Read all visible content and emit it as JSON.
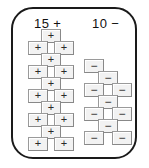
{
  "diagram": {
    "frame": {
      "stroke_color": "#1a1a1a"
    },
    "clusters": [
      {
        "id": "left",
        "label": "15 +",
        "count": 15,
        "polarity": "+",
        "terminal_symbol": "+",
        "terminals": [
          {
            "symbol": "+",
            "x": 41,
            "y": 29
          },
          {
            "symbol": "+",
            "x": 28,
            "y": 41
          },
          {
            "symbol": "+",
            "x": 54,
            "y": 41
          },
          {
            "symbol": "+",
            "x": 41,
            "y": 53
          },
          {
            "symbol": "+",
            "x": 28,
            "y": 65
          },
          {
            "symbol": "+",
            "x": 54,
            "y": 65
          },
          {
            "symbol": "+",
            "x": 41,
            "y": 77
          },
          {
            "symbol": "+",
            "x": 28,
            "y": 89
          },
          {
            "symbol": "+",
            "x": 54,
            "y": 89
          },
          {
            "symbol": "+",
            "x": 41,
            "y": 101
          },
          {
            "symbol": "+",
            "x": 28,
            "y": 113
          },
          {
            "symbol": "+",
            "x": 54,
            "y": 113
          },
          {
            "symbol": "+",
            "x": 41,
            "y": 125
          },
          {
            "symbol": "+",
            "x": 28,
            "y": 137
          },
          {
            "symbol": "+",
            "x": 54,
            "y": 137
          }
        ]
      },
      {
        "id": "right",
        "label": "10 −",
        "count": 10,
        "polarity": "−",
        "terminal_symbol": "−",
        "terminals": [
          {
            "symbol": "−",
            "x": 84,
            "y": 59
          },
          {
            "symbol": "−",
            "x": 98,
            "y": 71
          },
          {
            "symbol": "−",
            "x": 84,
            "y": 83
          },
          {
            "symbol": "−",
            "x": 112,
            "y": 83
          },
          {
            "symbol": "−",
            "x": 98,
            "y": 95
          },
          {
            "symbol": "−",
            "x": 84,
            "y": 107
          },
          {
            "symbol": "−",
            "x": 112,
            "y": 107
          },
          {
            "symbol": "−",
            "x": 98,
            "y": 119
          },
          {
            "symbol": "−",
            "x": 84,
            "y": 131
          },
          {
            "symbol": "−",
            "x": 112,
            "y": 131
          }
        ]
      }
    ]
  }
}
